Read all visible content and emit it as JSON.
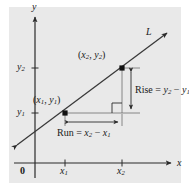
{
  "figure": {
    "background_color": "#ffffff",
    "plot_background_color": "#e9e9e9",
    "ink_color": "#1a1a1a",
    "axes": {
      "x_axis_label": "x",
      "y_axis_label": "y",
      "origin_label": "0",
      "x_ticks": [
        {
          "id": "x1",
          "base": "x",
          "sub": "1"
        },
        {
          "id": "x2",
          "base": "x",
          "sub": "2"
        }
      ],
      "y_ticks": [
        {
          "id": "y1",
          "base": "y",
          "sub": "1"
        },
        {
          "id": "y2",
          "base": "y",
          "sub": "2"
        }
      ]
    },
    "line": {
      "label": "L",
      "direction": "increasing",
      "arrowheads": "both"
    },
    "points": [
      {
        "id": "p1",
        "label_open": "(",
        "x_base": "x",
        "x_sub": "1",
        "sep": ", ",
        "y_base": "y",
        "y_sub": "1",
        "label_close": ")"
      },
      {
        "id": "p2",
        "label_open": "(",
        "x_base": "x",
        "x_sub": "2",
        "sep": ", ",
        "y_base": "y",
        "y_sub": "2",
        "label_close": ")"
      }
    ],
    "annotations": {
      "rise": {
        "name": "Rise",
        "equals": " = ",
        "term1_base": "y",
        "term1_sub": "2",
        "minus": " − ",
        "term2_base": "y",
        "term2_sub": "1"
      },
      "run": {
        "name": "Run",
        "equals": " = ",
        "term1_base": "x",
        "term1_sub": "2",
        "minus": " − ",
        "term2_base": "x",
        "term2_sub": "1"
      },
      "right_angle_marker": "right-angle"
    }
  }
}
